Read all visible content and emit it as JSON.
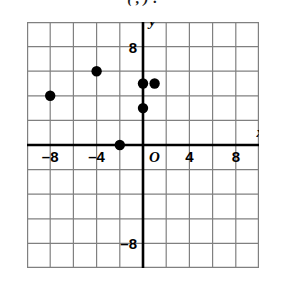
{
  "caption": {
    "text": "(   ,   )  ?"
  },
  "chart_data": {
    "type": "scatter",
    "title": "",
    "xlabel": "x",
    "ylabel": "y",
    "xlim": [
      -10,
      10
    ],
    "ylim": [
      -10,
      10
    ],
    "grid": true,
    "grid_step": 2,
    "legend": "none",
    "axis_labels": {
      "x": "x",
      "y": "y"
    },
    "origin_label": "O",
    "xticks": [
      -8,
      -4,
      4,
      8
    ],
    "xtick_labels": [
      "–8",
      "–4",
      "4",
      "8"
    ],
    "yticks": [
      8,
      -8
    ],
    "ytick_labels": [
      "8",
      "–8"
    ],
    "point_color": "#000000",
    "grid_color": "#808080",
    "axis_color": "#000000",
    "points": [
      {
        "x": -8,
        "y": 4,
        "label": "(–8, 4)"
      },
      {
        "x": -4,
        "y": 6,
        "label": "(–4, 6)"
      },
      {
        "x": -2,
        "y": 0,
        "label": "(–2, 0)"
      },
      {
        "x": 0,
        "y": 3,
        "label": "(0, 3)"
      },
      {
        "x": 0,
        "y": 5,
        "label": "(0, 5)"
      },
      {
        "x": 1,
        "y": 5,
        "label": "(1, 5)"
      }
    ]
  }
}
